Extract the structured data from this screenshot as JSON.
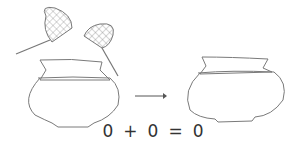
{
  "diagram": {
    "left_pot": {
      "description": "pot with two nets (empty)",
      "nets": 2
    },
    "arrow": {
      "direction": "right"
    },
    "right_pot": {
      "description": "empty pot"
    },
    "equation": {
      "left_operand": "0",
      "operator": "+",
      "right_operand": "0",
      "equals": "=",
      "result": "0"
    },
    "colors": {
      "stroke": "#7a7a7a",
      "text": "#333333"
    }
  }
}
